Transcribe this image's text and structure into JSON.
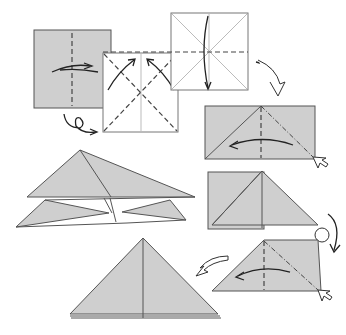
{
  "diagram": {
    "title": "",
    "paper_color": "#cfcfcf",
    "line_color": "#555555",
    "steps": [
      {
        "id": 1,
        "name": "colored-square",
        "instruction": "valley fold in half and unfold, then turn over"
      },
      {
        "id": 2,
        "name": "white-square-diagonals",
        "instruction": "valley fold diagonals and unfold"
      },
      {
        "id": 3,
        "name": "square-horizontal-fold",
        "instruction": "fold top down along horizontal crease"
      },
      {
        "id": 4,
        "name": "rectangle-squash",
        "instruction": "valley fold center, mountain fold diagonal, squash left"
      },
      {
        "id": 5,
        "name": "half-squashed",
        "instruction": "turn over"
      },
      {
        "id": 6,
        "name": "repeat-squash",
        "instruction": "repeat squash fold behind"
      },
      {
        "id": 7,
        "name": "waterbomb-base",
        "instruction": "result: triangle base"
      },
      {
        "id": 8,
        "name": "open-triangle",
        "instruction": "side view of layered triangle"
      }
    ],
    "symbols": [
      "valley-fold-line",
      "mountain-fold-line",
      "fold-arrow",
      "turn-over-arrow",
      "push-arrow"
    ]
  }
}
